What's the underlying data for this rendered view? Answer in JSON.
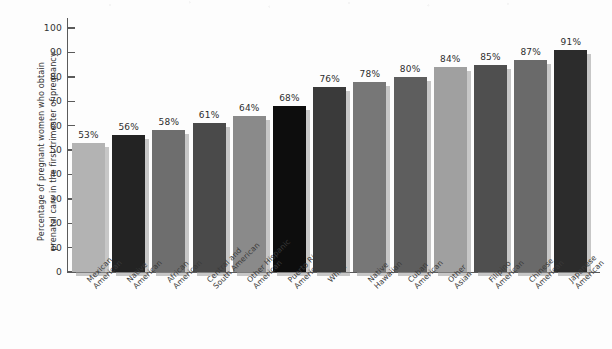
{
  "chart_data": {
    "type": "bar",
    "title": "",
    "subtitle": "",
    "xlabel": "",
    "ylabel": "Percentage of pregnant women who obtain\nprenatal care in the first trimester of pregnancy",
    "ylim": [
      0,
      100
    ],
    "ytick_labels": [
      "100",
      "90",
      "80",
      "70",
      "60",
      "50",
      "40",
      "30",
      "20",
      "10",
      "0"
    ],
    "ytick_values": [
      100,
      90,
      80,
      70,
      60,
      50,
      40,
      30,
      20,
      10,
      0
    ],
    "grid": false,
    "legend": "none",
    "categories": [
      "Mexican\nAmerican",
      "Native\nAmerican",
      "African\nAmerican",
      "Central and\nSouth American",
      "Other Hispanic\nAmerican",
      "Puerto Rican\nAmerican",
      "White",
      "Native\nHawaiian",
      "Cuban\nAmerican",
      "Other\nAsian",
      "Filipino\nAmerican",
      "Chinese\nAmerican",
      "Japanese\nAmerican"
    ],
    "values": [
      53,
      56,
      58,
      61,
      64,
      68,
      76,
      78,
      80,
      84,
      85,
      87,
      91
    ],
    "value_labels": [
      "53%",
      "56%",
      "58%",
      "61%",
      "64%",
      "68%",
      "76%",
      "78%",
      "80%",
      "84%",
      "85%",
      "87%",
      "91%"
    ],
    "bar_colors": [
      "#b3b3b3",
      "#232323",
      "#6e6e6e",
      "#4a4a4a",
      "#8a8a8a",
      "#0d0d0d",
      "#3a3a3a",
      "#777777",
      "#5e5e5e",
      "#a0a0a0",
      "#4f4f4f",
      "#6a6a6a",
      "#2c2c2c"
    ],
    "axis_color": "#5a5a5a"
  }
}
